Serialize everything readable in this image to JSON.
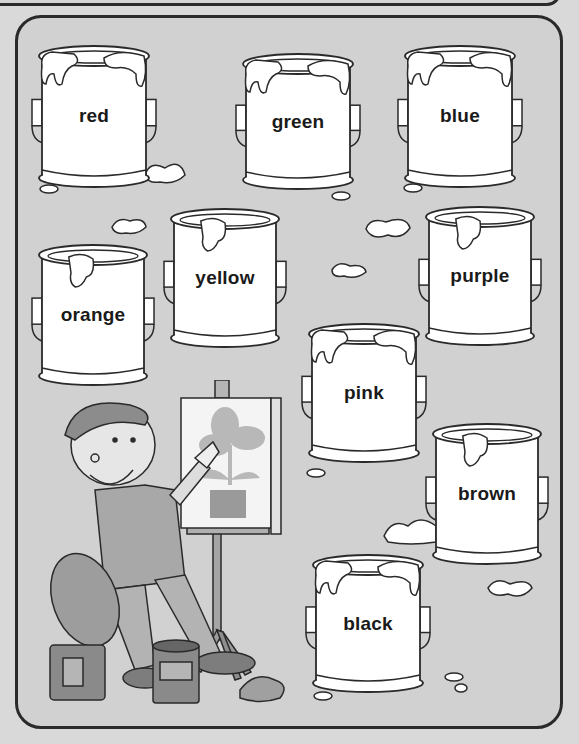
{
  "worksheet": {
    "cans": [
      {
        "id": "red",
        "label": "red",
        "x": 38,
        "y": 44,
        "w": 112,
        "h": 146,
        "drips": 2
      },
      {
        "id": "green",
        "label": "green",
        "x": 242,
        "y": 52,
        "w": 112,
        "h": 140,
        "drips": 2
      },
      {
        "id": "blue",
        "label": "blue",
        "x": 404,
        "y": 44,
        "w": 112,
        "h": 146,
        "drips": 2
      },
      {
        "id": "yellow",
        "label": "yellow",
        "x": 170,
        "y": 207,
        "w": 110,
        "h": 143,
        "drips": 1
      },
      {
        "id": "orange",
        "label": "orange",
        "x": 38,
        "y": 243,
        "w": 110,
        "h": 145,
        "drips": 1
      },
      {
        "id": "purple",
        "label": "purple",
        "x": 425,
        "y": 205,
        "w": 110,
        "h": 143,
        "drips": 1
      },
      {
        "id": "pink",
        "label": "pink",
        "x": 308,
        "y": 322,
        "w": 112,
        "h": 143,
        "drips": 2
      },
      {
        "id": "brown",
        "label": "brown",
        "x": 432,
        "y": 422,
        "w": 110,
        "h": 145,
        "drips": 1
      },
      {
        "id": "black",
        "label": "black",
        "x": 312,
        "y": 553,
        "w": 112,
        "h": 142,
        "drips": 2
      }
    ]
  },
  "illustration": {
    "subject": "boy artist in beret at easel painting a flower",
    "palette_held": true
  },
  "colors": {
    "background": "#d1d1d1",
    "outline": "#2a2a2a",
    "can_fill": "#ffffff",
    "text": "#1a1a1a"
  }
}
